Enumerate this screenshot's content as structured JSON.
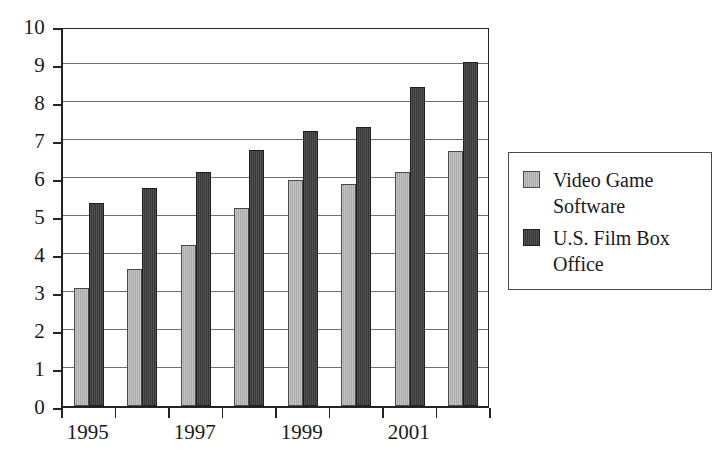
{
  "chart_data": {
    "type": "bar",
    "title": "",
    "subtitle": "",
    "xlabel": "",
    "ylabel": "",
    "ylim": [
      0,
      10
    ],
    "ytick_step": 1,
    "grid": true,
    "legend_position": "right",
    "categories": [
      "1995",
      "1996",
      "1997",
      "1998",
      "1999",
      "2000",
      "2001",
      "2002"
    ],
    "visible_xtick_labels": [
      "1995",
      "",
      "1997",
      "",
      "1999",
      "",
      "2001",
      ""
    ],
    "ytick_labels": [
      "0",
      "1",
      "2",
      "3",
      "4",
      "5",
      "6",
      "7",
      "8",
      "9",
      "10"
    ],
    "series": [
      {
        "name": "Video Game Software",
        "color": "#aaaaaa",
        "values": [
          3.1,
          3.6,
          4.25,
          5.2,
          5.95,
          5.85,
          6.15,
          6.7
        ]
      },
      {
        "name": "U.S. Film Box Office",
        "color": "#383838",
        "values": [
          5.35,
          5.75,
          6.15,
          6.75,
          7.25,
          7.35,
          8.4,
          9.05
        ]
      }
    ]
  },
  "legend": {
    "items": [
      {
        "label_line1": "Video Game",
        "label_line2": "Software",
        "swatch": "gray-swatch"
      },
      {
        "label_line1": "U.S. Film Box",
        "label_line2": "Office",
        "swatch": "dark-swatch"
      }
    ]
  },
  "colors": {
    "series_gray": "#aaaaaa",
    "series_dark": "#383838",
    "axis": "#242424",
    "gridline": "#6e6e6e",
    "background": "#ffffff",
    "text": "#1a1a1a"
  }
}
